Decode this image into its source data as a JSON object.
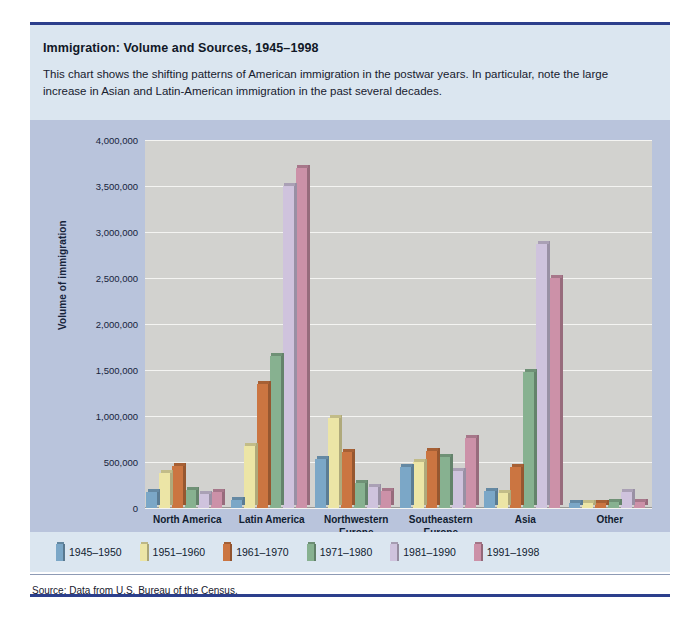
{
  "figure": {
    "title": "Immigration: Volume and Sources, 1945–1998",
    "description": "This chart shows the shifting patterns of American immigration in the postwar years. In particular, note the large increase in Asian and Latin-American immigration in the past several decades.",
    "source": "Source: Data from U.S. Bureau of the Census."
  },
  "chart_data": {
    "type": "bar",
    "title": "Immigration: Volume and Sources, 1945–1998",
    "xlabel": "",
    "ylabel": "Volume of immigration",
    "ylim": [
      0,
      4000000
    ],
    "ytick_labels": [
      "4,000,000",
      "3,500,000",
      "3,000,000",
      "2,500,000",
      "2,000,000",
      "1,500,000",
      "1,000,000",
      "500,000",
      "0"
    ],
    "ytick_values": [
      4000000,
      3500000,
      3000000,
      2500000,
      2000000,
      1500000,
      1000000,
      500000,
      0
    ],
    "grid": true,
    "legend_position": "bottom",
    "categories": [
      "North America",
      "Latin America",
      "Northwestern\nEurope",
      "Southeastern\nEurope",
      "Asia",
      "Other"
    ],
    "series": [
      {
        "name": "1945–1950",
        "color": "#7ba7c7",
        "values": [
          175000,
          90000,
          530000,
          450000,
          180000,
          50000
        ]
      },
      {
        "name": "1951–1960",
        "color": "#ece5a6",
        "values": [
          380000,
          670000,
          980000,
          500000,
          160000,
          50000
        ]
      },
      {
        "name": "1961–1970",
        "color": "#cb7541",
        "values": [
          460000,
          1350000,
          610000,
          620000,
          450000,
          50000
        ]
      },
      {
        "name": "1971–1980",
        "color": "#87b190",
        "values": [
          200000,
          1650000,
          270000,
          550000,
          1480000,
          70000
        ]
      },
      {
        "name": "1981–1990",
        "color": "#cfc3dd",
        "values": [
          150000,
          3500000,
          230000,
          400000,
          2870000,
          170000
        ]
      },
      {
        "name": "1991–1998",
        "color": "#cc91a8",
        "values": [
          170000,
          3700000,
          180000,
          760000,
          2500000,
          70000
        ]
      }
    ]
  },
  "colors": {
    "accent_rule": "#2c3f8c",
    "header_band": "#dbe6f0",
    "plot_band": "#b9c4dc",
    "plot_area": "#d2d2cf",
    "gridline": "#f4f4f2"
  }
}
